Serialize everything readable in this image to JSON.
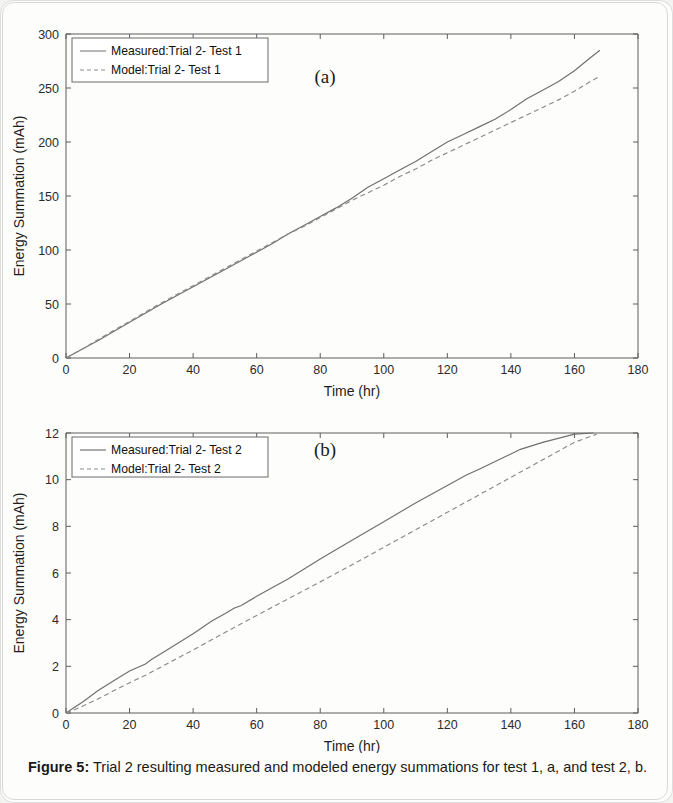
{
  "figure": {
    "caption_label": "Figure 5:",
    "caption_text": " Trial 2 resulting measured and modeled energy summations for test 1, a, and test 2, b."
  },
  "chart_data": [
    {
      "type": "line",
      "panel_label": "(a)",
      "title": "",
      "xlabel": "Time (hr)",
      "ylabel": "Energy Summation (mAh)",
      "xlim": [
        0,
        180
      ],
      "ylim": [
        0,
        300
      ],
      "xticks": [
        0,
        20,
        40,
        60,
        80,
        100,
        120,
        140,
        160,
        180
      ],
      "yticks": [
        0,
        50,
        100,
        150,
        200,
        250,
        300
      ],
      "grid": false,
      "legend_position": "upper-left",
      "series": [
        {
          "name": "Measured:Trial 2- Test 1",
          "style": "solid",
          "color": "#6f6f6f",
          "x": [
            0,
            5,
            10,
            20,
            30,
            40,
            50,
            60,
            65,
            70,
            75,
            80,
            85,
            90,
            95,
            100,
            105,
            110,
            115,
            120,
            125,
            130,
            135,
            140,
            145,
            150,
            155,
            160,
            165,
            168
          ],
          "y": [
            0,
            8,
            16,
            33,
            50,
            66,
            82,
            98,
            106,
            115,
            123,
            131,
            139,
            148,
            158,
            166,
            174,
            182,
            191,
            200,
            207,
            214,
            221,
            230,
            240,
            248,
            256,
            266,
            278,
            285
          ]
        },
        {
          "name": "Model:Trial 2- Test 1",
          "style": "dashed",
          "color": "#8a8a8a",
          "x": [
            0,
            5,
            10,
            20,
            30,
            40,
            50,
            60,
            65,
            70,
            75,
            80,
            85,
            90,
            95,
            100,
            105,
            110,
            115,
            120,
            125,
            130,
            135,
            140,
            145,
            150,
            155,
            160,
            165,
            168
          ],
          "y": [
            0,
            8,
            17,
            34,
            51,
            67,
            83,
            99,
            107,
            115,
            122,
            130,
            138,
            146,
            153,
            160,
            168,
            175,
            183,
            190,
            197,
            204,
            211,
            218,
            225,
            232,
            239,
            247,
            256,
            261
          ]
        }
      ]
    },
    {
      "type": "line",
      "panel_label": "(b)",
      "title": "",
      "xlabel": "Time (hr)",
      "ylabel": "Energy Summation (mAh)",
      "xlim": [
        0,
        180
      ],
      "ylim": [
        0,
        12
      ],
      "xticks": [
        0,
        20,
        40,
        60,
        80,
        100,
        120,
        140,
        160,
        180
      ],
      "yticks": [
        0,
        2,
        4,
        6,
        8,
        10,
        12
      ],
      "grid": false,
      "legend_position": "upper-left",
      "series": [
        {
          "name": "Measured:Trial 2- Test 2",
          "style": "solid",
          "color": "#6f6f6f",
          "x": [
            0,
            2,
            5,
            6,
            10,
            15,
            20,
            25,
            27,
            30,
            40,
            46,
            50,
            53,
            55,
            60,
            70,
            80,
            90,
            100,
            110,
            120,
            126,
            130,
            140,
            143,
            150,
            160,
            166
          ],
          "y": [
            0,
            0.18,
            0.45,
            0.55,
            0.95,
            1.38,
            1.8,
            2.1,
            2.3,
            2.55,
            3.4,
            3.95,
            4.25,
            4.5,
            4.6,
            5.0,
            5.75,
            6.6,
            7.4,
            8.2,
            9.0,
            9.75,
            10.2,
            10.45,
            11.1,
            11.3,
            11.6,
            11.95,
            12.0
          ]
        },
        {
          "name": "Model:Trial 2- Test 2",
          "style": "dashed",
          "color": "#8a8a8a",
          "x": [
            0,
            2,
            5,
            10,
            15,
            20,
            25,
            30,
            40,
            50,
            60,
            70,
            80,
            90,
            100,
            110,
            120,
            130,
            140,
            150,
            160,
            167
          ],
          "y": [
            0,
            0.1,
            0.28,
            0.6,
            0.95,
            1.3,
            1.62,
            1.98,
            2.7,
            3.45,
            4.18,
            4.9,
            5.62,
            6.35,
            7.1,
            7.85,
            8.6,
            9.35,
            10.1,
            10.85,
            11.6,
            11.95
          ]
        }
      ]
    }
  ]
}
